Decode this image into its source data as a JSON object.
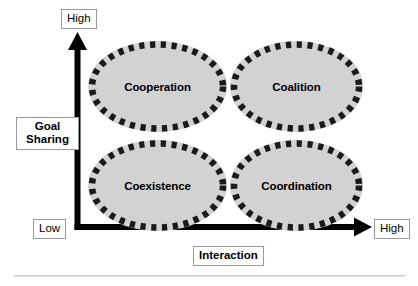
{
  "figure": {
    "type": "2x2-matrix-diagram",
    "axes": {
      "y": {
        "title": "Goal\nSharing",
        "high_label": "High",
        "low_label": "Low"
      },
      "x": {
        "title": "Interaction",
        "high_label": "High"
      }
    },
    "quadrants": [
      {
        "id": "cooperation",
        "label": "Cooperation",
        "goal_sharing": "High",
        "interaction": "Low"
      },
      {
        "id": "coalition",
        "label": "Coalition",
        "goal_sharing": "High",
        "interaction": "High"
      },
      {
        "id": "coexistence",
        "label": "Coexistence",
        "goal_sharing": "Low",
        "interaction": "Low"
      },
      {
        "id": "coordination",
        "label": "Coordination",
        "goal_sharing": "Low",
        "interaction": "High"
      }
    ],
    "colors": {
      "ellipse_fill": "#d2d2d2",
      "ellipse_border": "#1a1a1a",
      "axis": "#000000",
      "label_box_border": "#9a9a9a",
      "rule": "#c9c9c9",
      "background": "#ffffff"
    }
  }
}
